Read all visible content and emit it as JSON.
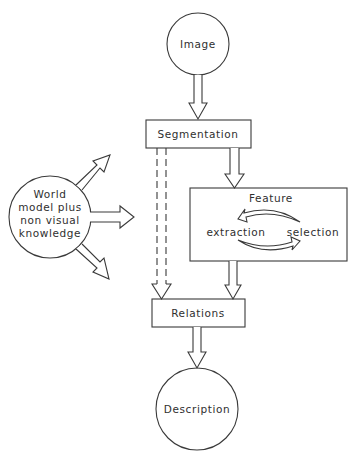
{
  "diagram": {
    "type": "flowchart",
    "nodes": {
      "image": {
        "label": "Image",
        "shape": "circle"
      },
      "segmentation": {
        "label": "Segmentation",
        "shape": "box"
      },
      "feature": {
        "label": "Feature",
        "shape": "box",
        "sub_labels": {
          "extraction": "extraction",
          "selection": "selection"
        }
      },
      "relations": {
        "label": "Relations",
        "shape": "box"
      },
      "description": {
        "label": "Description",
        "shape": "circle"
      },
      "world_model": {
        "label_lines": [
          "World",
          "model plus",
          "non visual",
          "knowledge"
        ],
        "shape": "circle"
      }
    },
    "edges": [
      {
        "from": "image",
        "to": "segmentation",
        "style": "hollow-arrow"
      },
      {
        "from": "segmentation",
        "to": "feature",
        "style": "hollow-arrow"
      },
      {
        "from": "segmentation",
        "to": "relations",
        "style": "dashed-hollow-arrow"
      },
      {
        "from": "feature",
        "to": "relations",
        "style": "hollow-arrow"
      },
      {
        "from": "relations",
        "to": "description",
        "style": "hollow-arrow"
      },
      {
        "from": "feature.extraction",
        "to": "feature.selection",
        "style": "curved-arrow"
      },
      {
        "from": "feature.selection",
        "to": "feature.extraction",
        "style": "curved-arrow"
      },
      {
        "from": "world_model",
        "to": "up-right",
        "style": "hollow-arrow"
      },
      {
        "from": "world_model",
        "to": "right",
        "style": "hollow-arrow"
      },
      {
        "from": "world_model",
        "to": "down-right",
        "style": "hollow-arrow"
      }
    ]
  }
}
